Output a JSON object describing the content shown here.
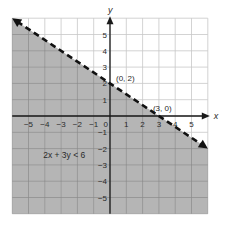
{
  "chart_data": {
    "type": "line",
    "title": "",
    "xlabel": "x",
    "ylabel": "y",
    "xlim": [
      -6,
      6
    ],
    "ylim": [
      -6,
      6
    ],
    "grid": true,
    "x_ticks": [
      -5,
      -4,
      -3,
      -2,
      -1,
      0,
      1,
      2,
      3,
      4,
      5
    ],
    "y_ticks": [
      -5,
      -4,
      -3,
      -2,
      -1,
      1,
      2,
      3,
      4,
      5
    ],
    "series": [
      {
        "name": "2x + 3y = 6",
        "style": "dashed",
        "x": [
          -6,
          6
        ],
        "y": [
          6,
          -2
        ]
      }
    ],
    "shaded_region": {
      "inequality": "2x + 3y < 6",
      "side": "below",
      "color": "#b5b5b5"
    },
    "annotations": [
      {
        "text": "(0, 2)",
        "x": 0,
        "y": 2
      },
      {
        "text": "(3, 0)",
        "x": 3,
        "y": 0
      },
      {
        "text": "2x + 3y < 6",
        "x": -3.5,
        "y": -2.5
      }
    ]
  },
  "labels": {
    "x_axis": "x",
    "y_axis": "y",
    "point_a": "(0, 2)",
    "point_b": "(3, 0)",
    "inequality": "2x  + 3y < 6",
    "origin": "0"
  },
  "colors": {
    "shade": "#b5b5b5",
    "grid_shaded": "#8c8c8c",
    "grid_unshaded": "#c8c8c8",
    "axis": "#1a1a1a",
    "line": "#111111"
  }
}
